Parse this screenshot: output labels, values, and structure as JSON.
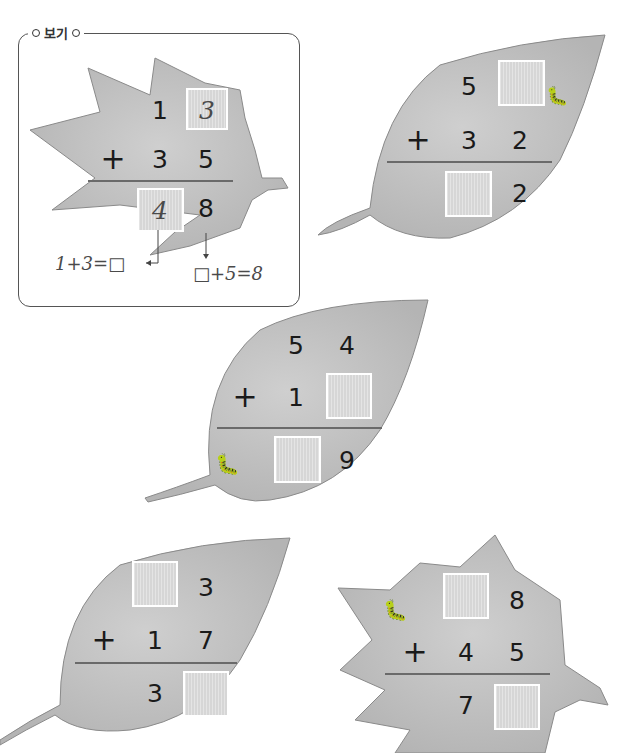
{
  "example": {
    "label": "보기",
    "problem": {
      "top": [
        "1",
        "3"
      ],
      "operator": "+",
      "bottom": [
        "3",
        "5"
      ],
      "result": [
        "4",
        "8"
      ],
      "filled_boxes": {
        "top_ones": "3",
        "result_tens": "4"
      }
    },
    "hint_left": "1+3=□",
    "hint_right": "□+5=8"
  },
  "problems": [
    {
      "id": "p1",
      "top": [
        "5",
        ""
      ],
      "operator": "+",
      "bottom": [
        "3",
        "2"
      ],
      "result": [
        "",
        "2"
      ],
      "blanks": [
        "top_ones",
        "result_tens"
      ],
      "has_caterpillar": true
    },
    {
      "id": "p2",
      "top": [
        "5",
        "4"
      ],
      "operator": "+",
      "bottom": [
        "1",
        ""
      ],
      "result": [
        "",
        "9"
      ],
      "blanks": [
        "bottom_ones",
        "result_tens"
      ],
      "has_caterpillar": true
    },
    {
      "id": "p3",
      "top": [
        "",
        "3"
      ],
      "operator": "+",
      "bottom": [
        "1",
        "7"
      ],
      "result": [
        "3",
        ""
      ],
      "blanks": [
        "top_tens",
        "result_ones"
      ],
      "has_caterpillar": false
    },
    {
      "id": "p4",
      "top": [
        "",
        "8"
      ],
      "operator": "+",
      "bottom": [
        "4",
        "5"
      ],
      "result": [
        "7",
        ""
      ],
      "blanks": [
        "top_tens",
        "result_ones"
      ],
      "has_caterpillar": true
    }
  ],
  "colors": {
    "leaf": "#c4c4c4",
    "leaf_edge": "#8a8a8a",
    "box": "#d6d6d6",
    "frame": "#555555"
  }
}
